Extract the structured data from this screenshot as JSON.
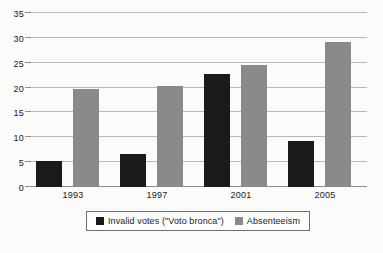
{
  "chart_data": {
    "type": "bar",
    "title": "",
    "subtitle": "",
    "xlabel": "",
    "ylabel": "",
    "categories": [
      "1993",
      "1997",
      "2001",
      "2005"
    ],
    "series": [
      {
        "name": "Invalid votes (\"Voto bronca\")",
        "color": "#1a1a1a",
        "values": [
          5.3,
          6.7,
          22.7,
          9.3
        ]
      },
      {
        "name": "Absenteeism",
        "color": "#8a8a8a",
        "values": [
          19.8,
          20.4,
          24.5,
          29.2
        ]
      }
    ],
    "ylim": [
      0,
      35
    ],
    "yticks": [
      0,
      5,
      10,
      15,
      20,
      25,
      30,
      35
    ],
    "ytick_labels": [
      "0",
      "5",
      "10",
      "15",
      "20",
      "25",
      "30",
      "35"
    ],
    "grid": true,
    "grid_axis": "y",
    "legend_position": "bottom-center",
    "legend": [
      {
        "label": "Invalid votes (\"Voto bronca\")",
        "swatch": "#1a1a1a"
      },
      {
        "label": "Absenteeism",
        "swatch": "#8a8a8a"
      }
    ],
    "background_color": "#fbfbfa",
    "gridline_color": "#b9b9b9",
    "axis_color": "#8c8c8c"
  }
}
